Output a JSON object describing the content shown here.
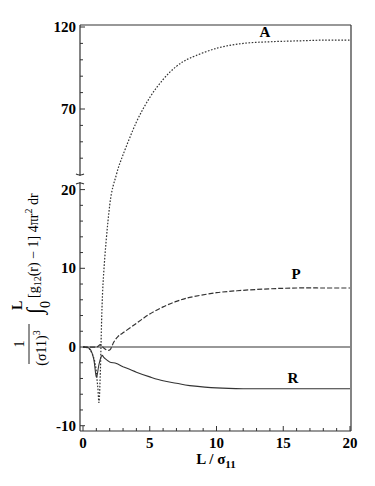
{
  "chart_data": {
    "type": "line",
    "title": "",
    "xlabel": "L / σ11",
    "xlabel_main": "L / σ",
    "xlabel_sub": "11",
    "ylabel": "1/(σ11)^3 ∫0^L [g12(r) − 1] 4πr^2 dr",
    "ylabel_parts": {
      "frac_num": "1",
      "frac_den": "(σ11)",
      "frac_den_exp": "3",
      "int_upper": "L",
      "int_lower": "0",
      "integrand": "[g",
      "integrand_sub": "12",
      "integrand_rest": "(r) − 1] 4πr",
      "r_exp": "2",
      "dr": " dr"
    },
    "xlim": [
      0,
      20
    ],
    "ylim": [
      -10,
      120
    ],
    "y_axis_break": {
      "lower_max": 20,
      "upper_min": 20,
      "note": "broken axis between 20 and upper segment"
    },
    "x_ticks": [
      "0",
      "5",
      "10",
      "15",
      "20"
    ],
    "y_ticks_lower": [
      "-10",
      "0",
      "10",
      "20"
    ],
    "y_ticks_upper": [
      "70",
      "120"
    ],
    "grid": false,
    "legend": "inline labels",
    "series": [
      {
        "name": "A",
        "style": "dotted",
        "x": [
          0,
          0.5,
          0.9,
          1.1,
          1.2,
          1.3,
          1.5,
          2,
          2.5,
          3,
          4,
          5,
          6,
          7,
          8,
          10,
          12,
          14,
          16,
          18,
          20
        ],
        "y": [
          0,
          -0.3,
          -2,
          -5,
          -7,
          -3,
          8,
          18,
          30,
          42,
          62,
          77,
          88,
          96,
          101,
          107,
          110,
          111,
          111.5,
          112,
          112
        ]
      },
      {
        "name": "P",
        "style": "dashed",
        "x": [
          0,
          1,
          1.3,
          1.6,
          2,
          2.3,
          2.6,
          3,
          4,
          5,
          6,
          7,
          8,
          10,
          12,
          14,
          16,
          18,
          20
        ],
        "y": [
          0,
          0,
          0.3,
          -0.2,
          -0.4,
          0.6,
          1.3,
          1.8,
          3.0,
          4.2,
          5.1,
          5.8,
          6.3,
          6.9,
          7.2,
          7.4,
          7.5,
          7.5,
          7.5
        ]
      },
      {
        "name": "R",
        "style": "solid",
        "x": [
          0,
          0.5,
          0.8,
          1.0,
          1.2,
          1.4,
          1.6,
          2,
          2.5,
          3,
          4,
          5,
          6,
          7,
          8,
          10,
          12,
          14,
          16,
          18,
          20
        ],
        "y": [
          0,
          -0.2,
          -1.5,
          -3.8,
          -2.2,
          -1.1,
          -1.4,
          -1.9,
          -2.1,
          -2.5,
          -3.2,
          -3.8,
          -4.3,
          -4.6,
          -4.9,
          -5.2,
          -5.3,
          -5.3,
          -5.3,
          -5.3,
          -5.3
        ]
      },
      {
        "name": "zero-line",
        "style": "solid",
        "x": [
          0,
          20
        ],
        "y": [
          0,
          0
        ]
      }
    ],
    "annotations": [
      {
        "text": "A",
        "x": 14,
        "y": 117
      },
      {
        "text": "P",
        "x": 15,
        "y": 9
      },
      {
        "text": "R",
        "x": 15,
        "y": -3.5
      }
    ]
  }
}
